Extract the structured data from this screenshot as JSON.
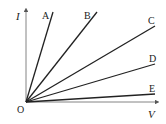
{
  "diagram": {
    "title": "",
    "axes": {
      "y_label": "I",
      "x_label": "V",
      "origin_label": "O"
    },
    "lines": [
      {
        "label": "A",
        "x2": 53,
        "y2": 12
      },
      {
        "label": "B",
        "x2": 97,
        "y2": 12
      },
      {
        "label": "C",
        "x2": 155,
        "y2": 26
      },
      {
        "label": "D",
        "x2": 155,
        "y2": 64
      },
      {
        "label": "E",
        "x2": 155,
        "y2": 94
      }
    ],
    "colors": {
      "line": "#222222",
      "axis": "#555555",
      "background": "#ffffff"
    }
  }
}
